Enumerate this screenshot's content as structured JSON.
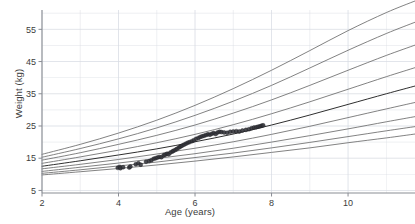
{
  "chart_data": {
    "type": "line",
    "title": "",
    "xlabel": "Age (years)",
    "ylabel": "Weight (kg)",
    "xlim": [
      2,
      11.75
    ],
    "ylim": [
      4.2,
      61
    ],
    "grid": true,
    "legend": "none",
    "xticks": [
      2,
      4,
      6,
      8,
      10
    ],
    "xtick_labels": [
      "2",
      "4",
      "6",
      "8",
      "10"
    ],
    "yticks": [
      5,
      15,
      25,
      35,
      45,
      55
    ],
    "ytick_labels": [
      "5",
      "15",
      "25",
      "35",
      "45",
      "55"
    ],
    "x_minor_step": 1,
    "y_minor_step": 5,
    "grid_color": "#d8dce3",
    "curve_color": "#6b6b6b",
    "median_curve_color": "#2f2f2f",
    "point_color": "#33343a",
    "axis_color": "#8a8d94",
    "text_color": "#3c3c3c",
    "series": [
      {
        "name": "P99.6",
        "color": "#6b6b6b",
        "x": [
          2,
          3,
          4,
          5,
          6,
          7,
          8,
          9,
          10,
          11,
          11.75
        ],
        "values": [
          16.2,
          19.3,
          22.8,
          26.8,
          31.4,
          36.6,
          42.3,
          48.4,
          54.6,
          60.2,
          63.8
        ]
      },
      {
        "name": "P98",
        "color": "#6b6b6b",
        "x": [
          2,
          3,
          4,
          5,
          6,
          7,
          8,
          9,
          10,
          11,
          11.75
        ],
        "values": [
          15.3,
          18.0,
          21.0,
          24.4,
          28.3,
          32.7,
          37.6,
          43.0,
          48.5,
          53.7,
          57.2
        ]
      },
      {
        "name": "P91",
        "color": "#6b6b6b",
        "x": [
          2,
          3,
          4,
          5,
          6,
          7,
          8,
          9,
          10,
          11,
          11.75
        ],
        "values": [
          14.4,
          16.7,
          19.3,
          22.1,
          25.3,
          29.0,
          33.1,
          37.6,
          42.3,
          46.9,
          50.1
        ]
      },
      {
        "name": "P75",
        "color": "#6b6b6b",
        "x": [
          2,
          3,
          4,
          5,
          6,
          7,
          8,
          9,
          10,
          11,
          11.75
        ],
        "values": [
          13.4,
          15.4,
          17.5,
          19.8,
          22.4,
          25.4,
          28.8,
          32.5,
          36.4,
          40.3,
          43.1
        ]
      },
      {
        "name": "P50",
        "color": "#2f2f2f",
        "x": [
          2,
          3,
          4,
          5,
          6,
          7,
          8,
          9,
          10,
          11,
          11.75
        ],
        "values": [
          12.5,
          14.2,
          16.0,
          17.9,
          20.1,
          22.5,
          25.3,
          28.4,
          31.7,
          35.0,
          37.4
        ]
      },
      {
        "name": "P25",
        "color": "#6b6b6b",
        "x": [
          2,
          3,
          4,
          5,
          6,
          7,
          8,
          9,
          10,
          11,
          11.75
        ],
        "values": [
          11.7,
          13.1,
          14.6,
          16.3,
          18.1,
          20.1,
          22.4,
          24.9,
          27.6,
          30.3,
          32.3
        ]
      },
      {
        "name": "P9",
        "color": "#6b6b6b",
        "x": [
          2,
          3,
          4,
          5,
          6,
          7,
          8,
          9,
          10,
          11,
          11.75
        ],
        "values": [
          10.9,
          12.2,
          13.5,
          14.9,
          16.4,
          18.1,
          20.0,
          22.0,
          24.1,
          26.3,
          27.9
        ]
      },
      {
        "name": "P2",
        "color": "#6b6b6b",
        "x": [
          2,
          3,
          4,
          5,
          6,
          7,
          8,
          9,
          10,
          11,
          11.75
        ],
        "values": [
          10.3,
          11.4,
          12.6,
          13.8,
          15.2,
          16.6,
          18.2,
          19.9,
          21.7,
          23.5,
          24.8
        ]
      },
      {
        "name": "P0.4",
        "color": "#6b6b6b",
        "x": [
          2,
          3,
          4,
          5,
          6,
          7,
          8,
          9,
          10,
          11,
          11.75
        ],
        "values": [
          9.8,
          10.8,
          11.8,
          12.9,
          14.1,
          15.4,
          16.8,
          18.2,
          19.8,
          21.3,
          22.5
        ]
      }
    ],
    "scatter": {
      "name": "observations",
      "color": "#33343a",
      "marker": "circle",
      "points": [
        [
          3.98,
          12.0
        ],
        [
          4.03,
          12.3
        ],
        [
          4.05,
          11.9
        ],
        [
          4.12,
          12.2
        ],
        [
          4.28,
          12.1
        ],
        [
          4.31,
          12.4
        ],
        [
          4.45,
          13.1
        ],
        [
          4.52,
          13.4
        ],
        [
          4.58,
          13.0
        ],
        [
          4.72,
          13.9
        ],
        [
          4.8,
          14.1
        ],
        [
          4.86,
          14.4
        ],
        [
          4.92,
          14.8
        ],
        [
          4.97,
          15.0
        ],
        [
          5.02,
          15.2
        ],
        [
          5.07,
          15.4
        ],
        [
          5.12,
          15.3
        ],
        [
          5.18,
          15.9
        ],
        [
          5.22,
          16.1
        ],
        [
          5.27,
          16.4
        ],
        [
          5.31,
          16.2
        ],
        [
          5.36,
          16.8
        ],
        [
          5.41,
          17.1
        ],
        [
          5.44,
          17.3
        ],
        [
          5.49,
          17.6
        ],
        [
          5.53,
          17.9
        ],
        [
          5.58,
          18.3
        ],
        [
          5.62,
          18.6
        ],
        [
          5.66,
          18.9
        ],
        [
          5.71,
          19.2
        ],
        [
          5.76,
          19.5
        ],
        [
          5.81,
          19.8
        ],
        [
          5.86,
          20.0
        ],
        [
          5.92,
          20.3
        ],
        [
          5.97,
          20.6
        ],
        [
          6.03,
          21.0
        ],
        [
          6.09,
          21.3
        ],
        [
          6.14,
          21.6
        ],
        [
          6.19,
          21.8
        ],
        [
          6.24,
          22.0
        ],
        [
          6.29,
          22.2
        ],
        [
          6.34,
          22.4
        ],
        [
          6.39,
          22.3
        ],
        [
          6.44,
          22.6
        ],
        [
          6.49,
          22.8
        ],
        [
          6.54,
          22.5
        ],
        [
          6.59,
          23.0
        ],
        [
          6.64,
          23.2
        ],
        [
          6.69,
          23.1
        ],
        [
          6.76,
          23.0
        ],
        [
          6.84,
          22.9
        ],
        [
          6.92,
          23.2
        ],
        [
          7.0,
          23.3
        ],
        [
          7.08,
          23.4
        ],
        [
          7.16,
          23.3
        ],
        [
          7.24,
          23.6
        ],
        [
          7.33,
          23.8
        ],
        [
          7.41,
          24.0
        ],
        [
          7.48,
          24.3
        ],
        [
          7.54,
          24.5
        ],
        [
          7.6,
          24.6
        ],
        [
          7.65,
          24.8
        ],
        [
          7.7,
          24.9
        ],
        [
          7.74,
          25.1
        ],
        [
          7.78,
          25.2
        ]
      ]
    }
  }
}
